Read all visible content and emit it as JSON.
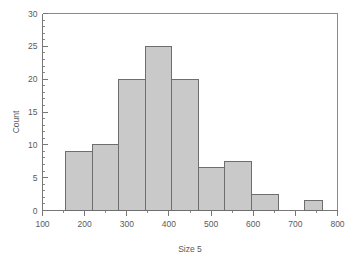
{
  "chart_data": {
    "type": "bar",
    "title": "",
    "subtitle": "",
    "xlabel": "Size 5",
    "ylabel": "Count",
    "xlim": [
      100,
      800
    ],
    "ylim": [
      0,
      30
    ],
    "grid": false,
    "legend": "none",
    "x_ticks": [
      100,
      200,
      300,
      400,
      500,
      600,
      700,
      800
    ],
    "x_tick_labels": [
      "100",
      "200",
      "300",
      "400",
      "500",
      "600",
      "700",
      "800"
    ],
    "x_minor_step": 50,
    "y_ticks": [
      0,
      5,
      10,
      15,
      20,
      25,
      30
    ],
    "y_tick_labels": [
      "0",
      "5",
      "10",
      "15",
      "20",
      "25",
      "30"
    ],
    "y_minor_step": 1,
    "bin_edges": [
      155,
      218,
      281,
      344,
      407,
      470,
      533,
      596,
      659,
      722,
      765
    ],
    "categories": [
      "155-218",
      "218-281",
      "281-344",
      "344-407",
      "407-470",
      "470-533",
      "533-596",
      "596-659",
      "659-722",
      "722-765"
    ],
    "values": [
      9,
      10,
      20,
      25,
      20,
      6.5,
      7.5,
      2.5,
      0,
      1.5
    ],
    "bar_fill": "#c9c9c9",
    "bar_stroke": "#6e6e6e",
    "axis_color": "#777777",
    "text_color": "#5a5a5a",
    "background": "#ffffff"
  }
}
